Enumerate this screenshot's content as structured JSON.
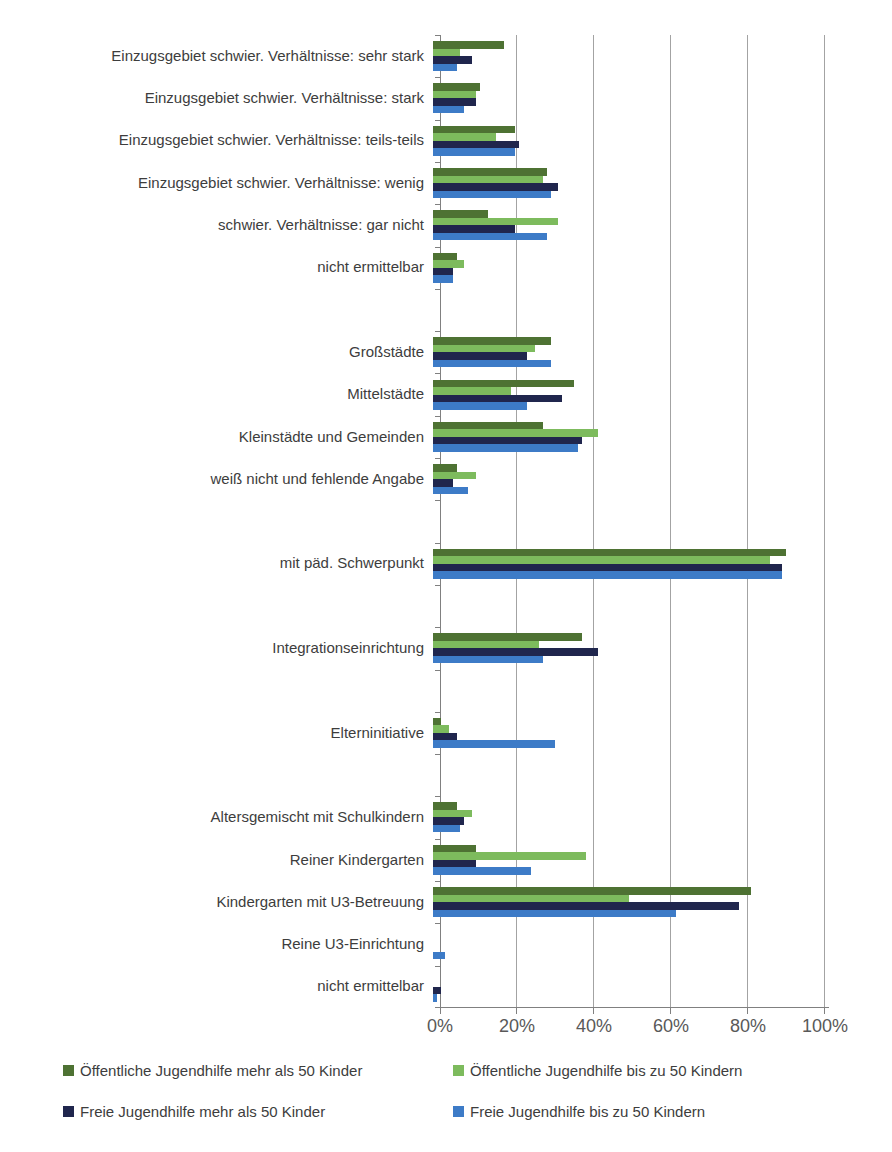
{
  "chart_data": {
    "type": "bar",
    "orientation": "horizontal",
    "x_axis": {
      "range": [
        0,
        100
      ],
      "tick_labels": [
        "0%",
        "20%",
        "40%",
        "60%",
        "80%",
        "100%"
      ],
      "grid": true
    },
    "series": [
      {
        "name": "Öffentliche Jugendhilfe mehr als 50 Kinder",
        "color": "#4e7233"
      },
      {
        "name": "Öffentliche Jugendhilfe bis zu 50 Kindern",
        "color": "#7dbb5d"
      },
      {
        "name": "Freie Jugendhilfe mehr als 50 Kinder",
        "color": "#20264d"
      },
      {
        "name": "Freie Jugendhilfe bis zu 50 Kindern",
        "color": "#3d7bc7"
      }
    ],
    "rows": [
      {
        "label": "Einzugsgebiet schwier. Verhältnisse: sehr stark",
        "values": [
          18,
          7,
          10,
          6
        ]
      },
      {
        "label": "Einzugsgebiet schwier. Verhältnisse: stark",
        "values": [
          12,
          11,
          11,
          8
        ]
      },
      {
        "label": "Einzugsgebiet schwier. Verhältnisse: teils-teils",
        "values": [
          21,
          16,
          22,
          21
        ]
      },
      {
        "label": "Einzugsgebiet schwier. Verhältnisse: wenig",
        "values": [
          29,
          28,
          32,
          30
        ]
      },
      {
        "label": "schwier. Verhältnisse: gar nicht",
        "values": [
          14,
          32,
          21,
          29
        ]
      },
      {
        "label": "nicht ermittelbar",
        "values": [
          6,
          8,
          5,
          5
        ]
      },
      {
        "label": "",
        "values": []
      },
      {
        "label": "Großstädte",
        "values": [
          30,
          26,
          24,
          30
        ]
      },
      {
        "label": "Mittelstädte",
        "values": [
          36,
          20,
          33,
          24
        ]
      },
      {
        "label": "Kleinstädte und Gemeinden",
        "values": [
          28,
          42,
          38,
          37
        ]
      },
      {
        "label": "weiß nicht und fehlende Angabe",
        "values": [
          6,
          11,
          5,
          9
        ]
      },
      {
        "label": "",
        "values": []
      },
      {
        "label": "mit päd. Schwerpunkt",
        "values": [
          90,
          86,
          89,
          89
        ]
      },
      {
        "label": "",
        "values": []
      },
      {
        "label": "Integrationseinrichtung",
        "values": [
          38,
          27,
          42,
          28
        ]
      },
      {
        "label": "",
        "values": []
      },
      {
        "label": "Elterninitiative",
        "values": [
          2,
          4,
          6,
          31
        ]
      },
      {
        "label": "",
        "values": []
      },
      {
        "label": "Altersgemischt mit Schulkindern",
        "values": [
          6,
          10,
          8,
          7
        ]
      },
      {
        "label": "Reiner Kindergarten",
        "values": [
          11,
          39,
          11,
          25
        ]
      },
      {
        "label": "Kindergarten mit U3-Betreuung",
        "values": [
          81,
          50,
          78,
          62
        ]
      },
      {
        "label": "Reine U3-Einrichtung",
        "values": [
          0,
          0,
          0,
          3
        ]
      },
      {
        "label": "nicht ermittelbar",
        "values": [
          0,
          0,
          2,
          1
        ]
      }
    ],
    "legend": {
      "position": "bottom",
      "items": [
        "Öffentliche Jugendhilfe mehr als 50 Kinder",
        "Öffentliche Jugendhilfe bis zu 50 Kindern",
        "Freie Jugendhilfe mehr als 50 Kinder",
        "Freie Jugendhilfe bis zu 50 Kindern"
      ]
    },
    "colors": {
      "gridline": "#a3a3a3",
      "axis": "#808080",
      "category_label": "#3d3d3d",
      "tick_label": "#595959",
      "legend_label": "#3d3d3d"
    }
  }
}
